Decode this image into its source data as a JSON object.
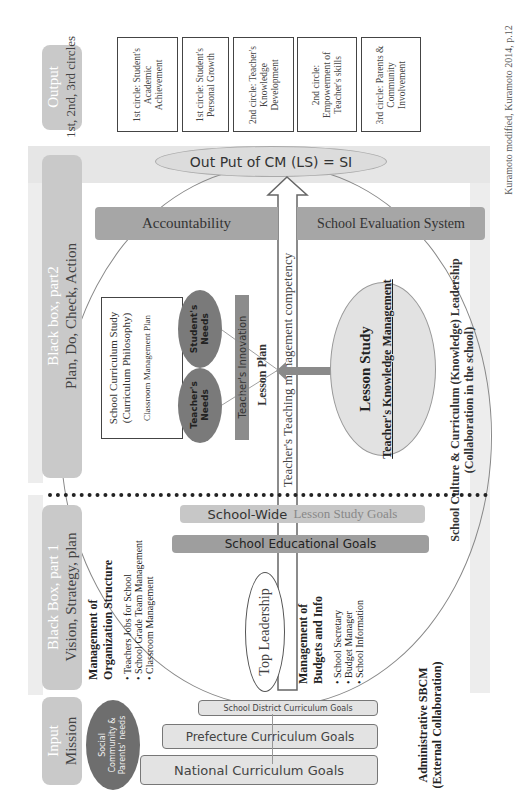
{
  "stages": {
    "output": {
      "title": "Output",
      "subtitle": "1st, 2nd, 3rd circles"
    },
    "black_box_2": {
      "title": "Black box, part2",
      "subtitle": "Plan, Do, Check, Action"
    },
    "black_box_1": {
      "title": "Black Box, part 1",
      "subtitle": "Vision, Strategy, plan"
    },
    "input": {
      "title": "Input",
      "subtitle": "Mission"
    }
  },
  "output_boxes": [
    {
      "label": "1st circle: Student's Academic Achievement"
    },
    {
      "label": "1st circle: Student's Personal Growth"
    },
    {
      "label": "2nd circle: Teacher's Knowledge Development"
    },
    {
      "label": "2nd circle: Empowerment of Teacher's skills"
    },
    {
      "label": "3rd circle: Parents & Community Involvement"
    }
  ],
  "output_ellipse": "Out Put of CM (LS) = SI",
  "accountability_bar": {
    "left": "Accountability",
    "right": "School Evaluation System"
  },
  "arrow_label": "Teacher's Teaching management competency",
  "curriculum_box": {
    "line1": "School Curriculum Study",
    "line2": "(Curriculum Philosophy)",
    "line3": "Classroom Management Plan"
  },
  "needs": {
    "student": "Student's Needs",
    "teacher": "Teacher's Needs"
  },
  "innovation_bar": "Teacher's Innovation",
  "lesson_plan": "Lesson Plan",
  "lesson_study": {
    "title": "Lesson Study",
    "subtitle": "Teacher's Knowledge Management"
  },
  "school_culture": {
    "line1": "School Culture & Curriculum (Knowledge) Leadership",
    "line2": "(Collaboration in the school)"
  },
  "goals_bars": {
    "school_wide_a": "School-Wide",
    "school_wide_b": "Lesson Study Goals",
    "educational": "School Educational Goals"
  },
  "org_management": {
    "title1": "Management of",
    "title2": "Organization Structure",
    "items": [
      "Teachers Jobs for School",
      "School Grade Team Management",
      "Classroom Management"
    ]
  },
  "top_leadership": "Top Leadership",
  "budget_management": {
    "title1": "Management of",
    "title2": "Budgets and Info",
    "items": [
      "School Secretary",
      "Budget Manager",
      "School Information"
    ]
  },
  "administrative": {
    "line1": "Administrative SBCM",
    "line2": "(External Collaboration)"
  },
  "social_needs": "Social Community & Parents' needs",
  "curriculum_goals": {
    "district": "School District  Curriculum Goals",
    "prefecture": "Prefecture Curriculum Goals",
    "national": "National Curriculum Goals"
  },
  "citation": "Kuramoto modified, Kuramoto 2014, p.12",
  "colors": {
    "stage": "#c9c9c9",
    "bar": "#a9a9a9",
    "band": "#e6e6e6",
    "ellipse_dark": "#7a7a7a"
  }
}
